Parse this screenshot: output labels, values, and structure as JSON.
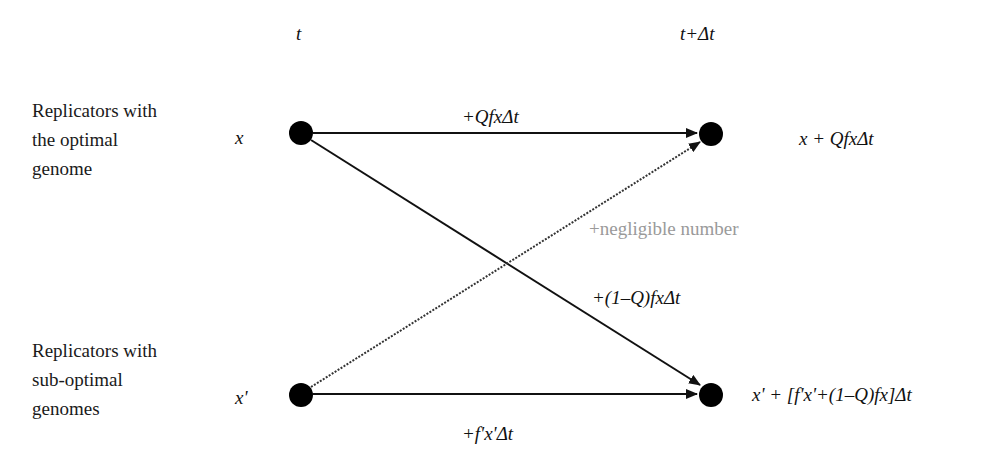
{
  "time_axis": {
    "start_label": "t",
    "end_label": "t+Δt"
  },
  "rows": [
    {
      "id": "optimal",
      "label": "Replicators with\nthe optimal\ngenome",
      "start_value": "x",
      "end_value": "x + QfxΔt"
    },
    {
      "id": "suboptimal",
      "label": "Replicators with\nsub-optimal\ngenomes",
      "start_value": "x'",
      "end_value": "x' + [f'x'+(1–Q)fx]Δt"
    }
  ],
  "edges": [
    {
      "id": "optimal-to-optimal",
      "from": "optimal",
      "to": "optimal",
      "label": "+QfxΔt",
      "style": "solid"
    },
    {
      "id": "optimal-to-suboptimal",
      "from": "optimal",
      "to": "suboptimal",
      "label": "+(1–Q)fxΔt",
      "style": "solid"
    },
    {
      "id": "suboptimal-to-optimal",
      "from": "suboptimal",
      "to": "optimal",
      "label": "+negligible number",
      "style": "dotted"
    },
    {
      "id": "suboptimal-to-suboptimal",
      "from": "suboptimal",
      "to": "suboptimal",
      "label": "+f'x'Δt",
      "style": "solid"
    }
  ],
  "colors": {
    "line": "#111111",
    "node": "#000000",
    "negligible_label": "#9a9a9a",
    "background": "#ffffff"
  }
}
